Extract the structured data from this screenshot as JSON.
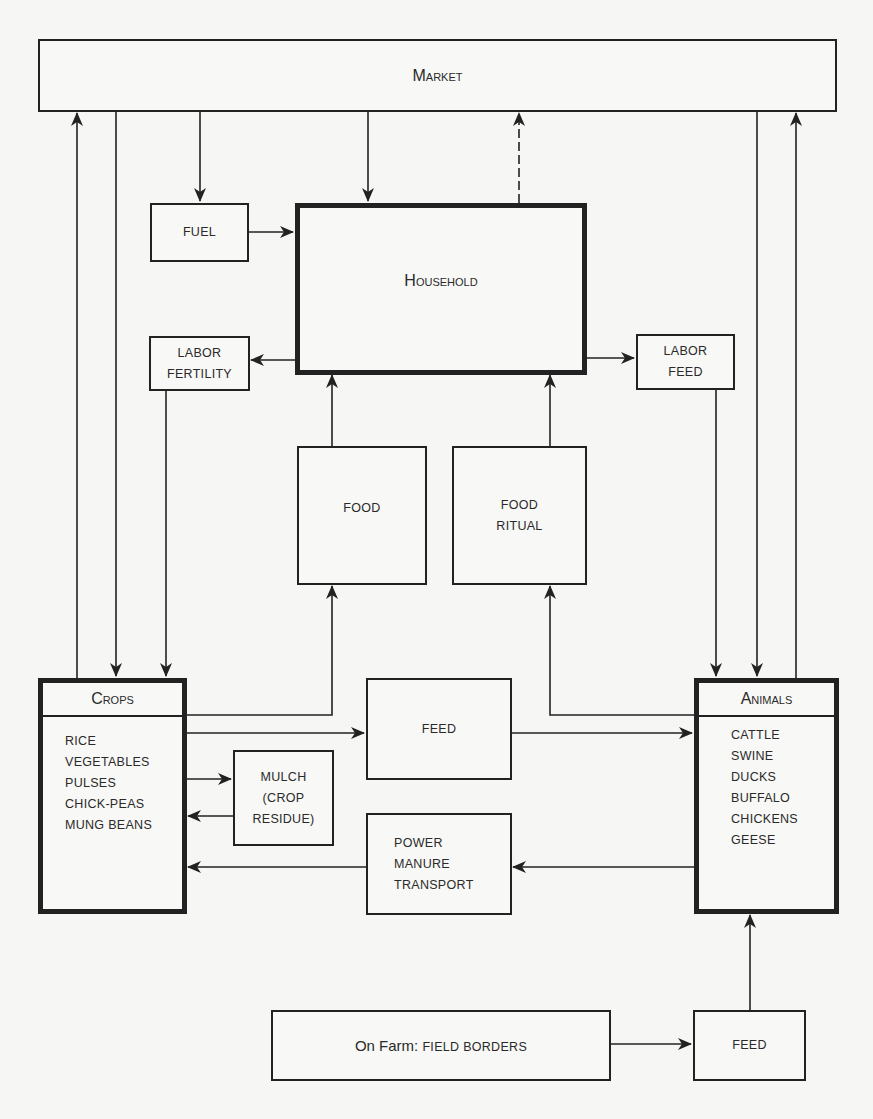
{
  "nodes": {
    "market": {
      "label": "Market"
    },
    "fuel": {
      "label": "FUEL"
    },
    "household": {
      "label": "Household"
    },
    "labor_fertility": {
      "line1": "LABOR",
      "line2": "FERTILITY"
    },
    "labor_feed": {
      "line1": "LABOR",
      "line2": "FEED"
    },
    "food": {
      "label": "FOOD"
    },
    "food_ritual": {
      "line1": "FOOD",
      "line2": "RITUAL"
    },
    "crops": {
      "title": "Crops",
      "items": [
        "RICE",
        "VEGETABLES",
        "PULSES",
        "CHICK-PEAS",
        "MUNG BEANS"
      ]
    },
    "feed_mid": {
      "label": "FEED"
    },
    "mulch": {
      "line1": "MULCH",
      "line2": "(CROP",
      "line3": "RESIDUE)"
    },
    "power": {
      "line1": "POWER",
      "line2": "MANURE",
      "line3": "TRANSPORT"
    },
    "animals": {
      "title": "Animals",
      "items": [
        "CATTLE",
        "SWINE",
        "DUCKS",
        "BUFFALO",
        "CHICKENS",
        "GEESE"
      ]
    },
    "on_farm": {
      "prefix": "On Farm:",
      "label": "FIELD BORDERS"
    },
    "feed_bottom": {
      "label": "FEED"
    }
  },
  "edges": [
    {
      "from": "crops",
      "to": "market"
    },
    {
      "from": "market",
      "to": "crops"
    },
    {
      "from": "market",
      "to": "fuel"
    },
    {
      "from": "market",
      "to": "household"
    },
    {
      "from": "household",
      "to": "market",
      "style": "dashed"
    },
    {
      "from": "market",
      "to": "animals"
    },
    {
      "from": "animals",
      "to": "market"
    },
    {
      "from": "fuel",
      "to": "household"
    },
    {
      "from": "household",
      "to": "labor_fertility"
    },
    {
      "from": "household",
      "to": "labor_feed"
    },
    {
      "from": "labor_fertility",
      "to": "crops"
    },
    {
      "from": "labor_feed",
      "to": "animals"
    },
    {
      "from": "food",
      "to": "household"
    },
    {
      "from": "food_ritual",
      "to": "household"
    },
    {
      "from": "crops",
      "to": "food"
    },
    {
      "from": "animals",
      "to": "food_ritual"
    },
    {
      "from": "crops",
      "to": "feed_mid"
    },
    {
      "from": "feed_mid",
      "to": "animals"
    },
    {
      "from": "crops",
      "to": "mulch"
    },
    {
      "from": "mulch",
      "to": "crops"
    },
    {
      "from": "animals",
      "to": "power"
    },
    {
      "from": "power",
      "to": "crops"
    },
    {
      "from": "on_farm",
      "to": "feed_bottom"
    },
    {
      "from": "feed_bottom",
      "to": "animals"
    }
  ]
}
